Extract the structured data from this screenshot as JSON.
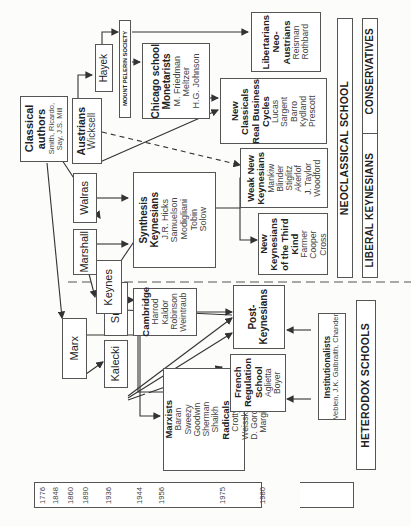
{
  "timeline": {
    "years": [
      "1776",
      "1848",
      "1860",
      "1890",
      "1936",
      "1944",
      "1956",
      "1975",
      "1980",
      "2006",
      "1967",
      "1906"
    ]
  },
  "nodes": {
    "classical": {
      "heading": "Classical",
      "heading2": "authors",
      "names": [
        "Smith, Ricardo,",
        "Say, J.S. Mill"
      ]
    },
    "marx": {
      "label": "Marx"
    },
    "kalecki": {
      "label": "Kalecki"
    },
    "sraffa": {
      "label": "Sraffa"
    },
    "keynes": {
      "label": "Keynes"
    },
    "marshall": {
      "label": "Marshall"
    },
    "walras": {
      "label": "Walras"
    },
    "austrians": {
      "heading": "Austrians",
      "names": [
        "Wicksell"
      ]
    },
    "hayek": {
      "label": "Hayek"
    },
    "mont_pelerin": {
      "label": "MOUNT PELERIN SOCIETY"
    },
    "marxists": {
      "heading": "Marxists",
      "names": [
        "Baran",
        "Sweezy",
        "Goodwin",
        "Sherman",
        "Shaikh"
      ]
    },
    "radicals": {
      "heading": "Radicals",
      "names": [
        "Crotty",
        "Weisskopf",
        "D. Gordon",
        "Margin"
      ]
    },
    "french": {
      "heading": [
        "French",
        "Regulation",
        "School"
      ],
      "names": [
        "Aglietta",
        "Boyer"
      ]
    },
    "post_keynesians": {
      "heading": [
        "Post-",
        "Keynesians"
      ]
    },
    "cambridge": {
      "heading": "Cambridge",
      "names": [
        "Harrod",
        "Kaldor",
        "Robinson",
        "Weintraub"
      ]
    },
    "institutionalists": {
      "heading": "Institutionalists",
      "names": [
        "Veblen, J.K. Galbraith, Chander"
      ]
    },
    "synthesis": {
      "heading": [
        "Synthesis",
        "Keynesians"
      ],
      "names": [
        "J.R. Hicks",
        "Samuelson",
        "Modigliani",
        "Tobin",
        "Solow"
      ]
    },
    "third_kind": {
      "heading": [
        "New",
        "Keynesians",
        "of the Third",
        "Kind"
      ],
      "names": [
        "Farmer",
        "Cooper",
        "Cross"
      ]
    },
    "weak_new": {
      "heading": [
        "Weak New",
        "Keynesians"
      ],
      "names": [
        "Mankiw",
        "Blinder",
        "Stiglitz",
        "Akerlof",
        "J. Taylor",
        "Woodford"
      ]
    },
    "new_classicals": {
      "heading": [
        "New",
        "Classicals",
        "Real Business",
        "Cycles"
      ],
      "names": [
        "Lucas",
        "Sargent",
        "Barro",
        "Kydland",
        "Prescott"
      ]
    },
    "chicago": {
      "heading": [
        "Chicago school",
        "Monetarists"
      ],
      "names": [
        "M. Friedman",
        "Meltzer",
        "H.G. Johnson"
      ]
    },
    "libertarians": {
      "heading": [
        "Libertarians",
        "Neo-",
        "Austrians"
      ],
      "names": [
        "Reisman",
        "Rothbard"
      ]
    }
  },
  "bands": {
    "heterodox": "HETERODOX SCHOOLS",
    "neoclassical": "NEOCLASSICAL SCHOOL",
    "liberal_keynesians": "LIBERAL KEYNESIANS",
    "conservatives": "CONSERVATIVES"
  }
}
